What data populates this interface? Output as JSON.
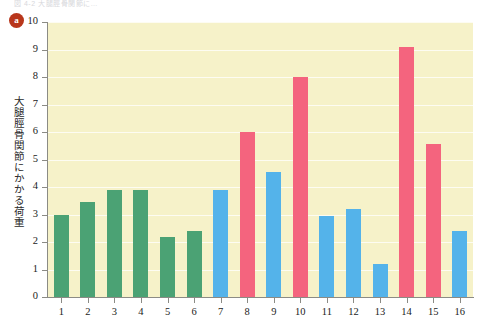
{
  "figure": {
    "panel_badge": "a",
    "faint_top_caption": "図 4-2  大腿脛骨関節に…",
    "background_color": "#ffffff"
  },
  "chart_data": {
    "type": "bar",
    "title": "",
    "subtitle": "",
    "xlabel": "",
    "ylabel": "大腿脛骨関節にかかる荷重",
    "ylim": [
      0,
      10
    ],
    "xlim_categories": 16,
    "grid": true,
    "grid_orientation": "horizontal",
    "legend": "none",
    "plot_background": "#f6f2c9",
    "categories": [
      "1",
      "2",
      "3",
      "4",
      "5",
      "6",
      "7",
      "8",
      "9",
      "10",
      "11",
      "12",
      "13",
      "14",
      "15",
      "16"
    ],
    "values": [
      3.0,
      3.45,
      3.9,
      3.9,
      2.2,
      2.4,
      3.9,
      6.0,
      4.55,
      8.0,
      2.95,
      3.2,
      1.2,
      9.1,
      5.55,
      2.4
    ],
    "bar_colors": [
      "#4ba274",
      "#4ba274",
      "#4ba274",
      "#4ba274",
      "#4ba274",
      "#4ba274",
      "#54b3ea",
      "#f4647e",
      "#54b3ea",
      "#f4647e",
      "#54b3ea",
      "#54b3ea",
      "#54b3ea",
      "#f4647e",
      "#f4647e",
      "#54b3ea"
    ],
    "group_colors": {
      "green": "#4ba274",
      "blue": "#54b3ea",
      "pink": "#f4647e"
    },
    "ytick_labels": [
      "10",
      "9",
      "8",
      "7",
      "6",
      "5",
      "4",
      "3",
      "2",
      "1",
      "0"
    ],
    "ytick_values": [
      10,
      9,
      8,
      7,
      6,
      5,
      4,
      3,
      2,
      1,
      0
    ],
    "xtick_labels": [
      "1",
      "2",
      "3",
      "4",
      "5",
      "6",
      "7",
      "8",
      "9",
      "10",
      "11",
      "12",
      "13",
      "14",
      "15",
      "16"
    ]
  }
}
